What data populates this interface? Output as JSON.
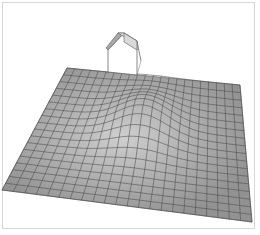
{
  "scene": {
    "description": "3D wireframe-shaded terrain mesh with a hill and a small house model",
    "colors": {
      "background": "#ffffff",
      "frame": "#d6d6d6",
      "mesh_fill": "#9a9a9a",
      "mesh_light": "#c2c2c2",
      "grid_line": "#4a4a4a",
      "house_roof": "#d9d9d9",
      "house_edge": "#6a6a6a"
    },
    "mesh": {
      "corners": {
        "top_left": [
          67,
          68
        ],
        "top_right": [
          240,
          85
        ],
        "bottom_right": [
          252,
          222
        ],
        "bottom_left": [
          2,
          190
        ]
      },
      "grid_columns": 22,
      "grid_rows": 18
    },
    "house": {
      "position": [
        108,
        37
      ]
    }
  }
}
